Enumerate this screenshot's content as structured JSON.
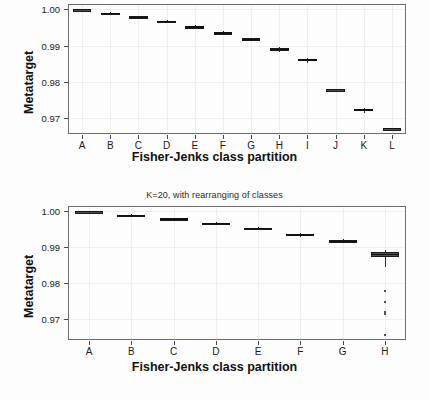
{
  "figure": {
    "background": "#ffffff",
    "width": 429,
    "height": 400
  },
  "panels": [
    {
      "id": "top",
      "title": "",
      "title_visible": false,
      "xlabel": "Fisher-Jenks class partition",
      "ylabel": "Metatarget"
    },
    {
      "id": "bottom",
      "title": "K=20, with rearranging of classes",
      "title_visible": true,
      "xlabel": "Fisher-Jenks class partition",
      "ylabel": "Metatarget"
    }
  ],
  "chart_data": [
    {
      "type": "box",
      "title": "",
      "xlabel": "Fisher-Jenks class partition",
      "ylabel": "Metatarget",
      "categories": [
        "A",
        "B",
        "C",
        "D",
        "E",
        "F",
        "G",
        "H",
        "I",
        "J",
        "K",
        "L"
      ],
      "ytick_labels": [
        "1.00",
        "0.99",
        "0.98",
        "0.97"
      ],
      "ytick_values": [
        1.0,
        0.99,
        0.98,
        0.97
      ],
      "ylim": [
        0.9655,
        1.0015
      ],
      "grid": true,
      "legend": "none",
      "boxes": [
        {
          "category": "A",
          "q1": 0.99985,
          "median": 0.99995,
          "q3": 1.0,
          "whisker_low": 0.99975,
          "whisker_high": 1.0,
          "outliers": []
        },
        {
          "category": "B",
          "q1": 0.9988,
          "median": 0.99895,
          "q3": 0.9991,
          "whisker_low": 0.99865,
          "whisker_high": 0.99925,
          "outliers": []
        },
        {
          "category": "C",
          "q1": 0.99775,
          "median": 0.9979,
          "q3": 0.99805,
          "whisker_low": 0.9976,
          "whisker_high": 0.9982,
          "outliers": []
        },
        {
          "category": "D",
          "q1": 0.99655,
          "median": 0.99672,
          "q3": 0.99688,
          "whisker_low": 0.9964,
          "whisker_high": 0.997,
          "outliers": []
        },
        {
          "category": "E",
          "q1": 0.99505,
          "median": 0.99522,
          "q3": 0.9954,
          "whisker_low": 0.99485,
          "whisker_high": 0.99558,
          "outliers": []
        },
        {
          "category": "F",
          "q1": 0.9933,
          "median": 0.9935,
          "q3": 0.99368,
          "whisker_low": 0.99305,
          "whisker_high": 0.9939,
          "outliers": []
        },
        {
          "category": "G",
          "q1": 0.9915,
          "median": 0.99172,
          "q3": 0.99195,
          "whisker_low": 0.9912,
          "whisker_high": 0.9922,
          "outliers": []
        },
        {
          "category": "H",
          "q1": 0.98875,
          "median": 0.989,
          "q3": 0.9893,
          "whisker_low": 0.9883,
          "whisker_high": 0.98955,
          "outliers": []
        },
        {
          "category": "I",
          "q1": 0.9857,
          "median": 0.986,
          "q3": 0.9863,
          "whisker_low": 0.9851,
          "whisker_high": 0.9866,
          "outliers": []
        },
        {
          "category": "J",
          "q1": 0.9777,
          "median": 0.9778,
          "q3": 0.9779,
          "whisker_low": 0.97765,
          "whisker_high": 0.97795,
          "outliers": []
        },
        {
          "category": "K",
          "q1": 0.97185,
          "median": 0.97215,
          "q3": 0.97245,
          "whisker_low": 0.9714,
          "whisker_high": 0.9728,
          "outliers": []
        },
        {
          "category": "L",
          "q1": 0.9669,
          "median": 0.967,
          "q3": 0.9671,
          "whisker_low": 0.96685,
          "whisker_high": 0.96715,
          "outliers": []
        }
      ]
    },
    {
      "type": "box",
      "title": "K=20, with rearranging of classes",
      "xlabel": "Fisher-Jenks class partition",
      "ylabel": "Metatarget",
      "categories": [
        "A",
        "B",
        "C",
        "D",
        "E",
        "F",
        "G",
        "H"
      ],
      "ytick_labels": [
        "1.00",
        "0.99",
        "0.98",
        "0.97"
      ],
      "ytick_values": [
        1.0,
        0.99,
        0.98,
        0.97
      ],
      "ylim": [
        0.964,
        1.0015
      ],
      "grid": true,
      "legend": "none",
      "boxes": [
        {
          "category": "A",
          "q1": 0.99988,
          "median": 0.99996,
          "q3": 1.0,
          "whisker_low": 0.9998,
          "whisker_high": 1.0,
          "outliers": []
        },
        {
          "category": "B",
          "q1": 0.9988,
          "median": 0.99895,
          "q3": 0.99908,
          "whisker_low": 0.99865,
          "whisker_high": 0.99922,
          "outliers": []
        },
        {
          "category": "C",
          "q1": 0.9977,
          "median": 0.99788,
          "q3": 0.99805,
          "whisker_low": 0.99752,
          "whisker_high": 0.99822,
          "outliers": []
        },
        {
          "category": "D",
          "q1": 0.9965,
          "median": 0.9967,
          "q3": 0.99688,
          "whisker_low": 0.9963,
          "whisker_high": 0.99705,
          "outliers": []
        },
        {
          "category": "E",
          "q1": 0.995,
          "median": 0.99522,
          "q3": 0.99545,
          "whisker_low": 0.9947,
          "whisker_high": 0.9957,
          "outliers": []
        },
        {
          "category": "F",
          "q1": 0.99325,
          "median": 0.99348,
          "q3": 0.9937,
          "whisker_low": 0.99295,
          "whisker_high": 0.99395,
          "outliers": []
        },
        {
          "category": "G",
          "q1": 0.9914,
          "median": 0.99168,
          "q3": 0.99195,
          "whisker_low": 0.99105,
          "whisker_high": 0.99225,
          "outliers": []
        },
        {
          "category": "H",
          "q1": 0.9872,
          "median": 0.9879,
          "q3": 0.9886,
          "whisker_low": 0.9843,
          "whisker_high": 0.9893,
          "outliers": [
            0.9776,
            0.9745,
            0.9718,
            0.9713,
            0.9653
          ]
        }
      ]
    }
  ]
}
